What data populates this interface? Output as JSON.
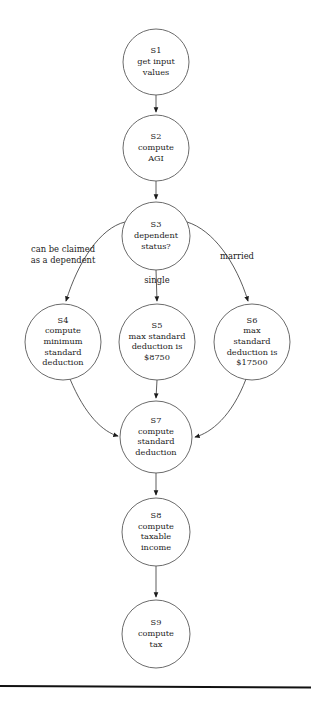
{
  "diagram": {
    "type": "flowchart",
    "colors": {
      "node_stroke": "#5a5a5a",
      "node_fill": "#ffffff",
      "edge_stroke": "#4a4a4a",
      "text": "#1c1c1c",
      "rule": "#111111",
      "background": "#ffffff"
    },
    "nodes": [
      {
        "id": "S1",
        "cx": 156,
        "cy": 62,
        "r": 33,
        "lines": [
          "S1",
          "get input",
          "values"
        ]
      },
      {
        "id": "S2",
        "cx": 156,
        "cy": 148,
        "r": 33,
        "lines": [
          "S2",
          "compute",
          "AGI"
        ]
      },
      {
        "id": "S3",
        "cx": 156,
        "cy": 236,
        "r": 34,
        "lines": [
          "S3",
          "dependent",
          "status?"
        ]
      },
      {
        "id": "S4",
        "cx": 63,
        "cy": 342,
        "r": 38,
        "lines": [
          "S4",
          "compute",
          "minimum",
          "standard",
          "deduction"
        ]
      },
      {
        "id": "S5",
        "cx": 157,
        "cy": 342,
        "r": 38,
        "lines": [
          "S5",
          "max standard",
          "deduction is",
          "$8750"
        ]
      },
      {
        "id": "S6",
        "cx": 252,
        "cy": 342,
        "r": 38,
        "lines": [
          "S6",
          "max",
          "standard",
          "deduction is",
          "$17500"
        ]
      },
      {
        "id": "S7",
        "cx": 156,
        "cy": 437,
        "r": 36,
        "lines": [
          "S7",
          "compute",
          "standard",
          "deduction"
        ]
      },
      {
        "id": "S8",
        "cx": 156,
        "cy": 532,
        "r": 34,
        "lines": [
          "S8",
          "compute",
          "taxable",
          "income"
        ]
      },
      {
        "id": "S9",
        "cx": 156,
        "cy": 634,
        "r": 34,
        "lines": [
          "S9",
          "compute",
          "tax"
        ]
      }
    ],
    "edges": [
      {
        "id": "e-s1-s2",
        "from": "S1",
        "to": "S2",
        "path": "M 156 95 L 156 112",
        "label": ""
      },
      {
        "id": "e-s2-s3",
        "from": "S2",
        "to": "S3",
        "path": "M 156 181 L 156 199",
        "label": ""
      },
      {
        "id": "e-s3-s4",
        "from": "S3",
        "to": "S4",
        "path": "M 125 222 C 100 228 78 262 66 301",
        "label": "can be claimed\nas a dependent"
      },
      {
        "id": "e-s3-s5",
        "from": "S3",
        "to": "S5",
        "path": "M 156 270 L 157 301",
        "label": "single"
      },
      {
        "id": "e-s3-s6",
        "from": "S3",
        "to": "S6",
        "path": "M 187 222 C 213 230 236 262 248 301",
        "label": "married"
      },
      {
        "id": "e-s4-s7",
        "from": "S4",
        "to": "S7",
        "path": "M 70 379 C 85 415 103 432 118 436",
        "label": ""
      },
      {
        "id": "e-s5-s7",
        "from": "S5",
        "to": "S7",
        "path": "M 157 380 L 156 398",
        "label": ""
      },
      {
        "id": "e-s6-s7",
        "from": "S6",
        "to": "S7",
        "path": "M 246 379 C 232 416 211 433 195 437",
        "label": ""
      },
      {
        "id": "e-s7-s8",
        "from": "S7",
        "to": "S8",
        "path": "M 156 473 L 156 495",
        "label": ""
      },
      {
        "id": "e-s8-s9",
        "from": "S8",
        "to": "S9",
        "path": "M 156 566 L 156 597",
        "label": ""
      }
    ],
    "edge_labels": [
      {
        "id": "label-dependent",
        "lines": [
          "can be claimed",
          "as a dependent"
        ],
        "x": 63,
        "y": 249,
        "line_height": 11
      },
      {
        "id": "label-single",
        "lines": [
          "single"
        ],
        "x": 157,
        "y": 280,
        "line_height": 11
      },
      {
        "id": "label-married",
        "lines": [
          "married"
        ],
        "x": 237,
        "y": 256,
        "line_height": 11
      }
    ]
  },
  "footer": {
    "rule_y": 686,
    "caption": ""
  }
}
